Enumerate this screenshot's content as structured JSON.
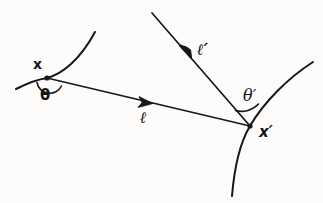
{
  "figure": {
    "kind": "hand-drawn-geometry-diagram",
    "background_color": "#fdfcfa",
    "ink_color": "#171717",
    "width": 323,
    "height": 203,
    "labels": {
      "point_x": "x",
      "point_x_prime": "x′",
      "angle_theta": "θ",
      "angle_theta_prime": "θ′",
      "segment_ell": "ℓ",
      "segment_ell_prime": "ℓ′"
    },
    "strokes": {
      "left_curve": {
        "name": "left-boundary-curve",
        "path": "M 16 89 C 30 82 40 79 47 78 C 62 74 80 60 95 32",
        "width": 2.0
      },
      "right_curve": {
        "name": "right-boundary-curve",
        "path": "M 232 196 C 234 172 238 146 250 126 C 264 102 288 78 313 62",
        "width": 2.0
      },
      "segment_ell": {
        "name": "incoming-segment",
        "path": "M 47 78 L 250 126",
        "width": 1.7,
        "arrow_at": [
          148,
          102
        ],
        "arrow_angle_deg": 13.3
      },
      "segment_ell_prime": {
        "name": "outgoing-ray",
        "path": "M 250 126 L 152 13",
        "width": 1.7,
        "arrow_at": [
          186,
          52
        ],
        "arrow_angle_deg": 229.1
      },
      "angle_arc_theta": {
        "name": "theta-arc",
        "path": "M 37 83 A 13 13 0 0 0 62 86",
        "width": 1.6
      },
      "angle_arc_theta_prime": {
        "name": "theta-prime-arc",
        "path": "M 236 110 A 22 22 0 0 0 258 105",
        "width": 1.6
      }
    },
    "vertices": [
      {
        "name": "vertex-x",
        "cx": 47,
        "cy": 78,
        "r": 2.6
      },
      {
        "name": "vertex-x-prime",
        "cx": 250,
        "cy": 126,
        "r": 2.6
      }
    ]
  }
}
